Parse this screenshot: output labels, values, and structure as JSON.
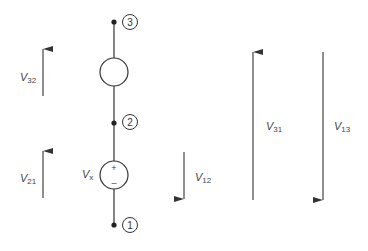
{
  "diagram": {
    "type": "circuit",
    "nodes": [
      {
        "id": "3",
        "label": "3",
        "x": 114,
        "y": 22
      },
      {
        "id": "2",
        "label": "2",
        "x": 114,
        "y": 123
      },
      {
        "id": "1",
        "label": "1",
        "x": 114,
        "y": 225
      }
    ],
    "elements": [
      {
        "id": "element-top",
        "between": [
          "3",
          "2"
        ],
        "label": ""
      },
      {
        "id": "source-vx",
        "between": [
          "2",
          "1"
        ],
        "label": "V",
        "label_sub": "x",
        "plus": "+",
        "minus": "–"
      }
    ],
    "voltage_arrows": [
      {
        "id": "v32",
        "label": "V",
        "sub": "32",
        "direction": "up"
      },
      {
        "id": "v21",
        "label": "V",
        "sub": "21",
        "direction": "up"
      },
      {
        "id": "v12",
        "label": "V",
        "sub": "12",
        "direction": "down"
      },
      {
        "id": "v31",
        "label": "V",
        "sub": "31",
        "direction": "up"
      },
      {
        "id": "v13",
        "label": "V",
        "sub": "13",
        "direction": "down"
      }
    ],
    "colors": {
      "line": "#333333",
      "text": "#444444"
    }
  }
}
